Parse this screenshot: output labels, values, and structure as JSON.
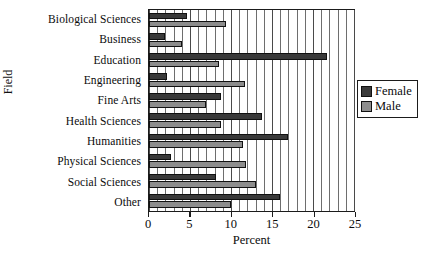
{
  "chart_data": {
    "type": "bar",
    "orientation": "horizontal",
    "title": "",
    "xlabel": "Percent",
    "ylabel": "Field",
    "xlim": [
      0,
      25
    ],
    "xticks": [
      0,
      5,
      10,
      15,
      20,
      25
    ],
    "xtick_labels": [
      "0",
      "5",
      "10",
      "15",
      "20",
      "25"
    ],
    "grid": true,
    "grid_minor_step": 1,
    "legend_position": "right",
    "categories": [
      "Biological Sciences",
      "Business",
      "Education",
      "Engineering",
      "Fine Arts",
      "Health Sciences",
      "Humanities",
      "Physical Sciences",
      "Social Sciences",
      "Other"
    ],
    "series": [
      {
        "name": "Female",
        "color": "#3a3a3a",
        "values": [
          4.6,
          2.0,
          21.7,
          2.2,
          8.8,
          13.8,
          17.0,
          2.7,
          8.2,
          16.0
        ]
      },
      {
        "name": "Male",
        "color": "#8d8d8d",
        "values": [
          9.4,
          4.0,
          8.5,
          11.7,
          6.9,
          8.8,
          11.5,
          11.8,
          13.0,
          10.0
        ]
      }
    ]
  },
  "legend": {
    "entries": [
      {
        "label": "Female",
        "color": "#3a3a3a"
      },
      {
        "label": "Male",
        "color": "#8d8d8d"
      }
    ]
  }
}
